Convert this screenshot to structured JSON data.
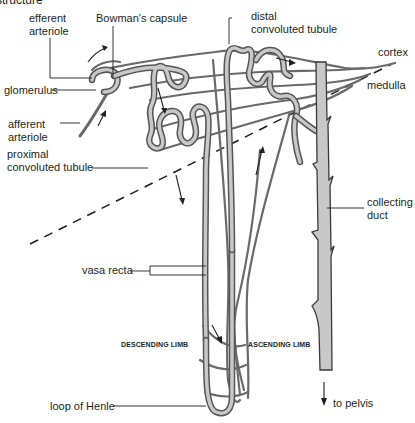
{
  "title_fragment": "structure",
  "labels": {
    "efferent_arteriole_1": "efferent",
    "efferent_arteriole_2": "arteriole",
    "bowmans_capsule": "Bowman's capsule",
    "distal_1": "distal",
    "distal_2": "convoluted tubule",
    "cortex": "cortex",
    "medulla": "medulla",
    "glomerulus": "glomerulus",
    "afferent_arteriole_1": "afferent",
    "afferent_arteriole_2": "arteriole",
    "proximal_1": "proximal",
    "proximal_2": "convoluted tubule",
    "collecting_duct_1": "collecting",
    "collecting_duct_2": "duct",
    "vasa_recta": "vasa recta",
    "descending_limb": "DESCENDING LIMB",
    "ascending_limb": "ASCENDING LIMB",
    "loop_of_henle": "loop of Henle",
    "to_pelvis": "to pelvis"
  },
  "colors": {
    "tubule_fill": "#c8c8c8",
    "tubule_outline": "#555555",
    "vessel": "#6a6a6a",
    "text": "#231f20",
    "background": "#ffffff"
  }
}
